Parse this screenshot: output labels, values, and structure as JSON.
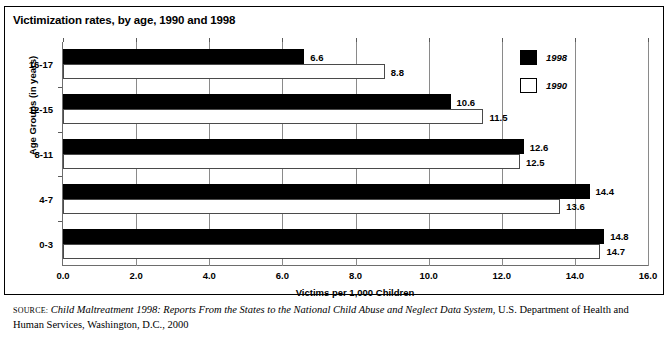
{
  "chart_data": {
    "type": "bar",
    "orientation": "horizontal",
    "title": "Victimization rates, by age, 1990 and 1998",
    "xlabel": "Victims per 1,000 Children",
    "ylabel": "Age Groups (in years)",
    "categories": [
      "16-17",
      "12-15",
      "8-11",
      "4-7",
      "0-3"
    ],
    "series": [
      {
        "name": "1998",
        "color": "#000000",
        "values": [
          6.6,
          10.6,
          12.6,
          14.4,
          14.8
        ]
      },
      {
        "name": "1990",
        "color": "#ffffff",
        "values": [
          8.8,
          11.5,
          12.5,
          13.6,
          14.7
        ]
      }
    ],
    "xlim": [
      0.0,
      16.0
    ],
    "xticks": [
      "0.0",
      "2.0",
      "4.0",
      "6.0",
      "8.0",
      "10.0",
      "12.0",
      "14.0",
      "16.0"
    ],
    "grid": "vertical",
    "legend_position": "top-right"
  },
  "legend": {
    "entries": [
      {
        "label": "1998",
        "style": "filled"
      },
      {
        "label": "1990",
        "style": "hollow"
      }
    ]
  },
  "source": {
    "kicker": "SOURCE:",
    "title": " Child Maltreatment 1998: Reports From the States to the National Child Abuse and Neglect Data System",
    "rest": ", U.S. Department of Health and Human Services, Washington, D.C., 2000"
  }
}
